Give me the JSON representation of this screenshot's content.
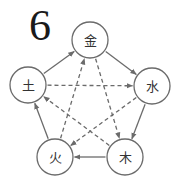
{
  "figure": {
    "number": "6",
    "stroke_color": "#6b6b6b",
    "nodes": [
      {
        "id": "metal",
        "label": "金",
        "cx": 90,
        "cy": 40,
        "r": 18
      },
      {
        "id": "water",
        "label": "水",
        "cx": 152,
        "cy": 86,
        "r": 18
      },
      {
        "id": "wood",
        "label": "木",
        "cx": 125,
        "cy": 157,
        "r": 18
      },
      {
        "id": "fire",
        "label": "火",
        "cx": 55,
        "cy": 157,
        "r": 18
      },
      {
        "id": "earth",
        "label": "土",
        "cx": 28,
        "cy": 85,
        "r": 18
      }
    ],
    "solid_edges": [
      {
        "from": "earth",
        "to": "metal"
      },
      {
        "from": "metal",
        "to": "water"
      },
      {
        "from": "water",
        "to": "wood"
      },
      {
        "from": "wood",
        "to": "fire"
      },
      {
        "from": "fire",
        "to": "earth"
      }
    ],
    "dashed_edges": [
      {
        "from": "earth",
        "to": "water"
      },
      {
        "from": "metal",
        "to": "wood"
      },
      {
        "from": "water",
        "to": "fire"
      },
      {
        "from": "wood",
        "to": "earth"
      },
      {
        "from": "fire",
        "to": "metal"
      }
    ]
  }
}
